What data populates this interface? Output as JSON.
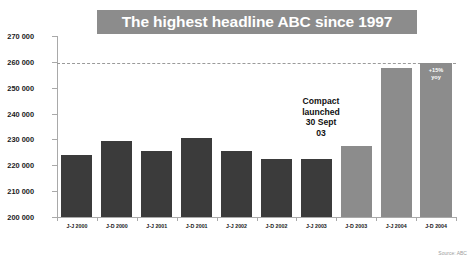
{
  "title": "The highest headline ABC since 1997",
  "source_note": "Source: ABC",
  "annotation": {
    "text": "Compact\nlaunched\n30 Sept\n03"
  },
  "colors": {
    "title_banner": "#8c8c8c",
    "title_text": "#ffffff",
    "bar_dark": "#3b3b3b",
    "bar_light": "#8c8c8c",
    "axis": "#a9a9a9",
    "reference_line": "#9a9a9a",
    "background": "#ffffff"
  },
  "chart_data": {
    "type": "bar",
    "title": "The highest headline ABC since 1997",
    "xlabel": "",
    "ylabel": "",
    "ylim": [
      200000,
      270000
    ],
    "ytick_step": 10000,
    "ytick_labels": [
      "200 000",
      "210 000",
      "220 000",
      "230 000",
      "240 000",
      "250 000",
      "260 000",
      "270 000"
    ],
    "grid": false,
    "legend": "none",
    "categories": [
      "J-J 2000",
      "J-D 2000",
      "J-J 2001",
      "J-D 2001",
      "J-J 2002",
      "J-D 2002",
      "J-J 2003",
      "J-D 2003",
      "J-J 2004",
      "J-D 2004"
    ],
    "values": [
      224000,
      229500,
      225500,
      230500,
      225500,
      222500,
      222500,
      227500,
      257500,
      259500
    ],
    "bar_styles": [
      "dark",
      "dark",
      "dark",
      "dark",
      "dark",
      "dark",
      "dark",
      "light",
      "light",
      "light"
    ],
    "bar_labels": [
      "",
      "",
      "",
      "",
      "",
      "",
      "",
      "",
      "",
      "+15%\nyoy"
    ],
    "reference_line": {
      "value": 259500,
      "style": "dashed"
    },
    "annotations": [
      {
        "text": "Compact launched 30 Sept 03",
        "target_category": "J-D 2003"
      }
    ]
  }
}
